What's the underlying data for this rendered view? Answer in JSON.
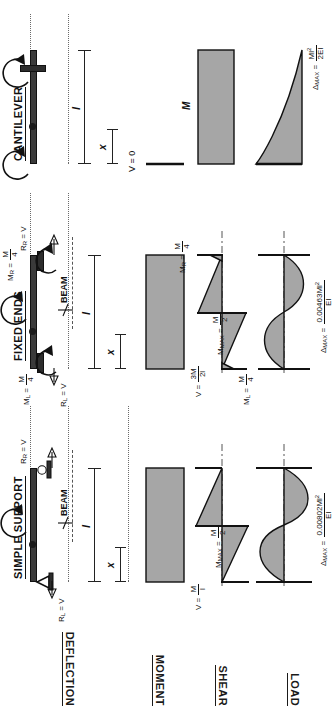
{
  "sheet": {
    "title_row_labels": [
      {
        "key": "load",
        "label": "LOAD"
      },
      {
        "key": "shear",
        "label": "SHEAR"
      },
      {
        "key": "moment",
        "label": "MOMENT"
      },
      {
        "key": "deflection",
        "label": "DEFLECTION"
      }
    ],
    "columns": [
      {
        "key": "simple",
        "label": "SIMPLE SUPPORT"
      },
      {
        "key": "fixed",
        "label": "FIXED ENDS"
      },
      {
        "key": "cantilever",
        "label": "CANTILEVER"
      }
    ]
  },
  "simple": {
    "span_label": "l",
    "x_label": "x",
    "applied_moment": "M",
    "centerline": "BEAM",
    "centerline_symbol": "℄",
    "reaction_left": {
      "name": "R",
      "sub": "L",
      "eq": "= V"
    },
    "reaction_right": {
      "name": "R",
      "sub": "R",
      "eq": "= V"
    },
    "shear_value": {
      "lhs": "V =",
      "num": "M",
      "den": "l"
    },
    "moment_max": {
      "lhs": "M",
      "sub": "MAX",
      "eq": "=",
      "num": "M",
      "den": "2"
    },
    "deflection_max": {
      "lhs": "Δ",
      "sub": "MAX",
      "eq": "=",
      "num": "0.00802Ml",
      "num_sup": "2",
      "den": "EI"
    }
  },
  "fixed": {
    "span_label": "l",
    "x_label": "x",
    "applied_moment": "M",
    "centerline": "BEAM",
    "centerline_symbol": "℄",
    "moment_left": {
      "name": "M",
      "sub": "L",
      "eq": "=",
      "num": "M",
      "den": "4"
    },
    "moment_right": {
      "name": "M",
      "sub": "R",
      "eq": "=",
      "num": "M",
      "den": "4"
    },
    "reaction_left": {
      "name": "R",
      "sub": "L",
      "eq": "= V"
    },
    "reaction_right": {
      "name": "R",
      "sub": "R",
      "eq": "= V"
    },
    "shear_value": {
      "lhs": "V =",
      "num": "3M",
      "den": "2l"
    },
    "moment_end_left": {
      "name": "M",
      "sub": "L",
      "eq": "=",
      "num": "M",
      "den": "4"
    },
    "moment_end_right": {
      "name": "M",
      "sub": "R",
      "eq": "=",
      "num": "M",
      "den": "4"
    },
    "moment_max": {
      "lhs": "M",
      "sub": "MAX",
      "eq": "=",
      "num": "M",
      "den": "2"
    },
    "deflection_max": {
      "lhs": "Δ",
      "sub": "MAX",
      "eq": "=",
      "num": "0.00463Ml",
      "num_sup": "2",
      "den": "EI"
    }
  },
  "cantilever": {
    "span_label": "l",
    "x_label": "x",
    "applied_moment": "M",
    "fixed_end_moment": {
      "name": "M",
      "sub": "R",
      "eq": "= M"
    },
    "shear_value": "V = 0",
    "moment_value": "M",
    "deflection_max": {
      "lhs": "Δ",
      "sub": "MAX",
      "eq": "=",
      "num": "Ml",
      "num_sup": "2",
      "den": "2EI"
    }
  },
  "colors": {
    "diagram_fill": "#a6a6a6",
    "ink": "#111111",
    "beam": "#3a3a3a",
    "guide": "#6b6b6b"
  }
}
